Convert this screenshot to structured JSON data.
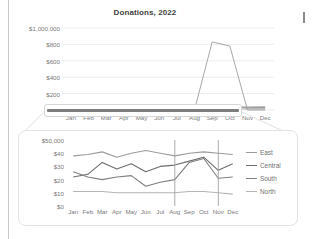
{
  "document": {
    "page_rule": true,
    "text_caret": true
  },
  "overview_chart": {
    "title": "Donations, 2022",
    "y_labels": [
      "$1,000,000",
      "$800",
      "$600",
      "$400",
      "$200",
      "$0"
    ],
    "x_labels": [
      "Jan",
      "Feb",
      "Mar",
      "Apr",
      "May",
      "Jun",
      "Jul",
      "Aug",
      "Sep",
      "Oct",
      "Nov",
      "Dec"
    ]
  },
  "selection": {
    "name": "magnifier-selection",
    "covers_months": [
      "Jan",
      "Dec"
    ]
  },
  "detail_chart": {
    "y_labels": [
      "$50,000",
      "$40",
      "$30",
      "$20",
      "$10",
      "$0"
    ],
    "x_labels": [
      "Jan",
      "Feb",
      "Mar",
      "Apr",
      "May",
      "Jun",
      "Jul",
      "Aug",
      "Sep",
      "Oct",
      "Nov",
      "Dec"
    ],
    "legend": [
      {
        "label": "East",
        "color": "#9b9b9b"
      },
      {
        "label": "Central",
        "color": "#6d6d6d"
      },
      {
        "label": "South",
        "color": "#7f7f7f"
      },
      {
        "label": "North",
        "color": "#b4b4b4"
      }
    ]
  },
  "chart_data": [
    {
      "type": "line",
      "title": "Donations, 2022",
      "xlabel": "",
      "ylabel": "",
      "categories": [
        "Jan",
        "Feb",
        "Mar",
        "Apr",
        "May",
        "Jun",
        "Jul",
        "Aug",
        "Sep",
        "Oct",
        "Nov",
        "Dec"
      ],
      "ylim": [
        0,
        1000
      ],
      "ytick_labels": [
        "$0",
        "$200",
        "$400",
        "$600",
        "$800",
        "$1,000,000"
      ],
      "ytick_values": [
        0,
        200,
        400,
        600,
        800,
        1000
      ],
      "grid": true,
      "legend_position": "none",
      "annotation": "A single large outlier in Sep-Oct flattens all four regional series near zero.",
      "series": [
        {
          "name": "East",
          "values": [
            38,
            39,
            41,
            37,
            40,
            42,
            40,
            38,
            40,
            41,
            40,
            39
          ]
        },
        {
          "name": "Central",
          "values": [
            22,
            24,
            33,
            28,
            32,
            26,
            30,
            31,
            34,
            37,
            27,
            32
          ]
        },
        {
          "name": "South",
          "values": [
            26,
            22,
            20,
            22,
            23,
            15,
            18,
            20,
            33,
            36,
            21,
            22
          ]
        },
        {
          "name": "North",
          "values": [
            11,
            11,
            11,
            10,
            10,
            10,
            10,
            10,
            11,
            11,
            10,
            9
          ]
        },
        {
          "name": "Outlier",
          "values": [
            0,
            0,
            0,
            0,
            0,
            0,
            0,
            0,
            830,
            780,
            0,
            0
          ]
        }
      ]
    },
    {
      "type": "line",
      "title": "",
      "xlabel": "",
      "ylabel": "",
      "categories": [
        "Jan",
        "Feb",
        "Mar",
        "Apr",
        "May",
        "Jun",
        "Jul",
        "Aug",
        "Sep",
        "Oct",
        "Nov",
        "Dec"
      ],
      "ylim": [
        0,
        50
      ],
      "ytick_labels": [
        "$0",
        "$10",
        "$20",
        "$30",
        "$40",
        "$50,000"
      ],
      "ytick_values": [
        0,
        10,
        20,
        30,
        40,
        50
      ],
      "grid": false,
      "legend_position": "right",
      "series": [
        {
          "name": "East",
          "values": [
            38,
            39,
            41,
            37,
            40,
            42,
            40,
            38,
            40,
            41,
            40,
            39
          ]
        },
        {
          "name": "Central",
          "values": [
            22,
            24,
            33,
            28,
            32,
            26,
            30,
            31,
            34,
            37,
            27,
            32
          ]
        },
        {
          "name": "South",
          "values": [
            26,
            22,
            20,
            22,
            23,
            15,
            18,
            20,
            33,
            36,
            21,
            22
          ]
        },
        {
          "name": "North",
          "values": [
            11,
            11,
            11,
            10,
            10,
            10,
            10,
            10,
            11,
            11,
            10,
            9
          ]
        },
        {
          "name": "Outlier",
          "values": [
            0,
            0,
            0,
            0,
            0,
            0,
            0,
            50,
            0,
            0,
            50,
            0
          ]
        }
      ]
    }
  ]
}
